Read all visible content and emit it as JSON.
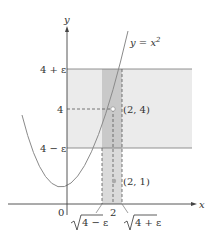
{
  "figure": {
    "colors": {
      "band_horizontal": "#ebebeb",
      "band_vertical": "#c9c9c9",
      "band_vertical_lower": "#dadada",
      "axis": "#444444",
      "curve": "#8a8a8a",
      "guide_line": "#777777",
      "dashed": "#555555",
      "point_fill_open": "#ffffff",
      "point_fill_filled": "#aaaaaa"
    },
    "axes": {
      "x_label": "x",
      "y_label": "y",
      "origin_label": "0"
    },
    "curve": {
      "label_prefix": "y = x",
      "label_exponent": "2"
    },
    "y_ticks": {
      "upper": "4 + ε",
      "mid": "4",
      "lower": "4 − ε"
    },
    "x_ticks": {
      "left_radicand": "4 − ε",
      "mid": "2",
      "right_radicand": "4 + ε"
    },
    "points": {
      "open": "(2, 4)",
      "filled": "(2, 1)"
    }
  }
}
